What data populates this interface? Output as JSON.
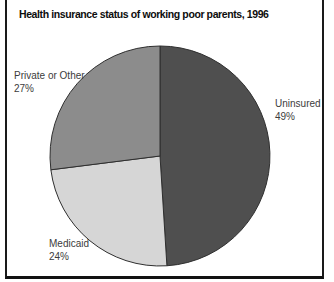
{
  "title": "Health insurance status of working poor parents, 1996",
  "chart_data": {
    "type": "pie",
    "title": "Health insurance status of working poor parents, 1996",
    "start_angle_deg": 0,
    "direction": "clockwise",
    "slices": [
      {
        "label": "Uninsured",
        "value": 49,
        "display": "49%",
        "color": "#4f4f4f",
        "label_position": "right"
      },
      {
        "label": "Medicaid",
        "value": 24,
        "display": "24%",
        "color": "#d6d6d6",
        "label_position": "bottom-left"
      },
      {
        "label": "Private or Other",
        "value": 27,
        "display": "27%",
        "color": "#8c8c8c",
        "label_position": "upper-left"
      }
    ],
    "outline_color": "#2f2f2f",
    "legend": "none",
    "labels_on": "outside"
  },
  "frame": {
    "border_color": "#1a1a1a"
  }
}
